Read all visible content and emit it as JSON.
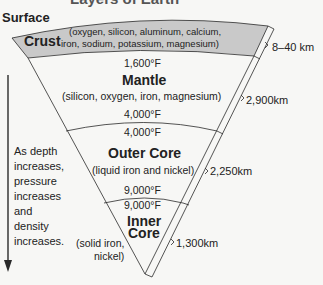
{
  "title": "Layers of Earth",
  "surface_label": "Surface",
  "layers": [
    {
      "name": "Crust",
      "composition_line1": "(oxygen, silicon, aluminum, calcium,",
      "composition_line2": "iron, sodium, potassium, magnesium)",
      "temp_bottom": "1,600°F",
      "thickness": "8–40 km",
      "fill": "#c9c9c9"
    },
    {
      "name": "Mantle",
      "composition": "(silicon, oxygen, iron, magnesium)",
      "temp_bottom": "4,000°F",
      "thickness": "2,900km",
      "fill": "#f7f7f5"
    },
    {
      "name": "Outer Core",
      "composition": "(liquid iron and nickel)",
      "temp_top": "4,000°F",
      "temp_bottom": "9,000°F",
      "thickness": "2,250km",
      "fill": "#f7f7f5"
    },
    {
      "name_line1": "Inner",
      "name_line2": "Core",
      "composition_line1": "(solid iron,",
      "composition_line2": "nickel)",
      "temp_top": "9,000°F",
      "thickness": "1,300km",
      "fill": "#f7f7f5"
    }
  ],
  "depth_note": "As depth increases, pressure increases and density increases.",
  "colors": {
    "line": "#2a2a2a",
    "crust": "#c9c9c9",
    "background": "#f7f7f5"
  }
}
